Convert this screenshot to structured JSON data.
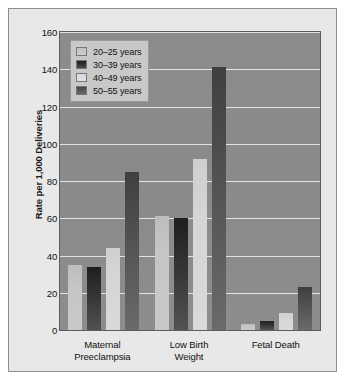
{
  "chart_data": {
    "type": "bar",
    "title": "",
    "xlabel": "",
    "ylabel": "Rate per 1,000 Deliveries",
    "ylim": [
      0,
      160
    ],
    "yticks": [
      160,
      140,
      120,
      100,
      80,
      60,
      40,
      20,
      0
    ],
    "grid": true,
    "legend_position": "top-left",
    "categories": [
      "Maternal Preeclampsia",
      "Low Birth Weight",
      "Fetal Death"
    ],
    "category_lines": [
      [
        "Maternal",
        "Preeclampsia"
      ],
      [
        "Low Birth",
        "Weight"
      ],
      [
        "Fetal Death",
        ""
      ]
    ],
    "series": [
      {
        "name": "20–25 years",
        "color": "#c6c6c6",
        "values": [
          35,
          61,
          3
        ]
      },
      {
        "name": "30–39 years",
        "color": "#2b2b2b",
        "values": [
          34,
          60,
          5
        ]
      },
      {
        "name": "40–49 years",
        "color": "#d6d6d6",
        "values": [
          44,
          92,
          9
        ]
      },
      {
        "name": "50–55 years",
        "color": "#565656",
        "values": [
          85,
          141,
          23
        ]
      }
    ]
  },
  "figure": {
    "frame_color": "#8e8e8e",
    "background_color": "#e8e8e8",
    "plot_background_color": "#8b8b8b",
    "gridline_color": "#e3e3e3",
    "legend_background_color": "#c8c8c8"
  }
}
